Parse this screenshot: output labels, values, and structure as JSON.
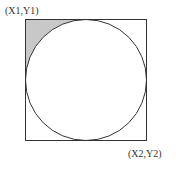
{
  "diagram": {
    "top_left_label": "(X1,Y1)",
    "bottom_right_label": "(X2,Y2)",
    "colors": {
      "stroke": "#333333",
      "corner_fill": "#c8c8c8",
      "background": "#ffffff"
    }
  }
}
